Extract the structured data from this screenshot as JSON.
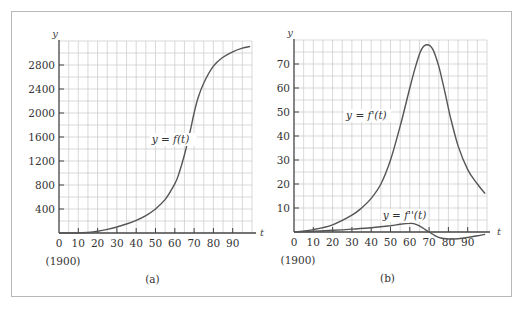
{
  "figure": {
    "colors": {
      "grid": "#c8c8c8",
      "axis": "#444444",
      "curve": "#555555",
      "frame": "#b8b8b8"
    }
  },
  "chart_data": [
    {
      "type": "line",
      "panel": "a",
      "caption": "(a)",
      "xlabel": "t",
      "ylabel": "y",
      "x_origin_note": "(1900)",
      "xlim": [
        0,
        100
      ],
      "ylim": [
        0,
        3200
      ],
      "x_ticks": [
        0,
        10,
        20,
        30,
        40,
        50,
        60,
        70,
        80,
        90
      ],
      "y_ticks": [
        400,
        800,
        1200,
        1600,
        2000,
        2400,
        2800
      ],
      "grid": true,
      "series": [
        {
          "name": "y = f(t)",
          "label_pos": {
            "t": 48,
            "y": 1500
          },
          "x": [
            0,
            10,
            15,
            20,
            25,
            30,
            35,
            40,
            45,
            50,
            55,
            60,
            62,
            65,
            68,
            70,
            72,
            75,
            80,
            85,
            90,
            95,
            99
          ],
          "values": [
            0,
            0,
            10,
            30,
            60,
            100,
            150,
            210,
            290,
            400,
            560,
            820,
            980,
            1300,
            1700,
            2000,
            2250,
            2500,
            2780,
            2930,
            3020,
            3080,
            3110
          ]
        }
      ]
    },
    {
      "type": "line",
      "panel": "b",
      "caption": "(b)",
      "xlabel": "t",
      "ylabel": "y",
      "x_origin_note": "(1900)",
      "xlim": [
        0,
        100
      ],
      "ylim": [
        0,
        80
      ],
      "x_ticks": [
        0,
        10,
        20,
        30,
        40,
        50,
        60,
        70,
        80,
        90
      ],
      "y_ticks": [
        10,
        20,
        30,
        40,
        50,
        60,
        70
      ],
      "grid": true,
      "series": [
        {
          "name": "y = f'(t)",
          "label_pos": {
            "t": 27,
            "y": 47
          },
          "x": [
            0,
            10,
            20,
            30,
            35,
            40,
            45,
            50,
            55,
            60,
            63,
            66,
            69,
            72,
            75,
            78,
            81,
            85,
            90,
            95,
            99
          ],
          "values": [
            0,
            1,
            3,
            7,
            10,
            14,
            20,
            30,
            44,
            60,
            69,
            76,
            78,
            76,
            69,
            59,
            48,
            36,
            26,
            20,
            16
          ]
        },
        {
          "name": "y = f''(t)",
          "label_pos": {
            "t": 46,
            "y": 5.5
          },
          "x": [
            0,
            10,
            20,
            30,
            40,
            50,
            55,
            60,
            62,
            65,
            68,
            70,
            73,
            76,
            80,
            85,
            90,
            95,
            99
          ],
          "values": [
            0,
            0.3,
            0.7,
            1.2,
            1.8,
            2.6,
            3.2,
            3.6,
            3.5,
            2.6,
            1.0,
            0,
            -1.5,
            -2.5,
            -2.9,
            -2.8,
            -2.3,
            -1.6,
            -1.0
          ]
        }
      ]
    }
  ]
}
